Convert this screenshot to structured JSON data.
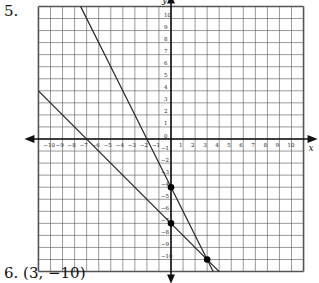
{
  "problem": {
    "number_label": "5."
  },
  "answer": {
    "label": "6.  (3, −10)"
  },
  "chart_data": {
    "type": "line",
    "title": "",
    "xlabel": "x",
    "ylabel": "y",
    "xlim": [
      -11,
      11
    ],
    "ylim": [
      -11,
      11
    ],
    "grid": true,
    "x_ticks": [
      -10,
      -9,
      -8,
      -7,
      -6,
      -5,
      -4,
      -3,
      -2,
      -1,
      1,
      2,
      3,
      4,
      5,
      6,
      7,
      8,
      9,
      10
    ],
    "y_ticks": [
      10,
      9,
      8,
      7,
      6,
      5,
      4,
      3,
      2,
      1,
      0,
      -1,
      -2,
      -3,
      -4,
      -5,
      -6,
      -7,
      -8,
      -9,
      -10
    ],
    "series": [
      {
        "name": "line-1",
        "equation": "y = -2x - 4",
        "slope": -2,
        "intercept": -4
      },
      {
        "name": "line-2",
        "equation": "y = -x - 7",
        "slope": -1,
        "intercept": -7
      }
    ],
    "points": [
      {
        "label": "y-intercept line 1",
        "x": 0,
        "y": -4
      },
      {
        "label": "y-intercept line 2",
        "x": 0,
        "y": -7
      },
      {
        "label": "intersection",
        "x": 3,
        "y": -10
      }
    ],
    "colors": {
      "grid": "#555555",
      "axis": "#111111",
      "line": "#222222",
      "point": "#000000"
    }
  }
}
